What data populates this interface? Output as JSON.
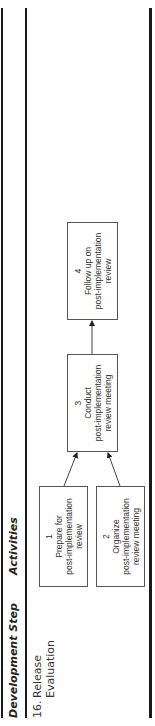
{
  "table": {
    "headers": {
      "development_step": "Development Step",
      "activities": "Activities"
    },
    "rows": [
      {
        "step_number": "16.",
        "step_name_line1": "Release",
        "step_name_line2": "Evaluation",
        "activities": [
          {
            "number": "1",
            "lines": [
              "Prepare for",
              "post-implementation",
              "review"
            ]
          },
          {
            "number": "2",
            "lines": [
              "Organize",
              "post-implementation",
              "review meeting"
            ]
          },
          {
            "number": "3",
            "lines": [
              "Conduct",
              "post-implementation",
              "review meeting"
            ]
          },
          {
            "number": "4",
            "lines": [
              "Follow up on",
              "post-implementation",
              "review"
            ]
          }
        ],
        "flow": [
          {
            "from": "1",
            "to": "3"
          },
          {
            "from": "2",
            "to": "3"
          },
          {
            "from": "3",
            "to": "4"
          }
        ]
      }
    ]
  },
  "page": {
    "orientation": "rotated-90-ccw"
  }
}
